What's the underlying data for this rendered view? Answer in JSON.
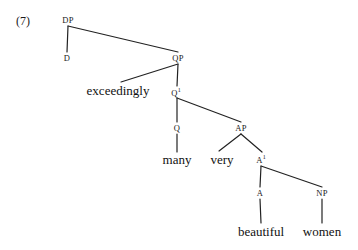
{
  "figure": {
    "example_number": "(7)",
    "kind": "syntax-tree",
    "sentence": "exceedingly many very beautiful women",
    "ink_color": "#222222",
    "background_color": "#ffffff"
  },
  "nodes": [
    {
      "id": "dp",
      "label": "DP",
      "bar": "",
      "type": "category",
      "x": 68,
      "y": 20
    },
    {
      "id": "d",
      "label": "D",
      "bar": "",
      "type": "category",
      "x": 67,
      "y": 58
    },
    {
      "id": "qp",
      "label": "QP",
      "bar": "",
      "type": "category",
      "x": 178,
      "y": 58
    },
    {
      "id": "exceedingly",
      "label": "exceedingly",
      "bar": "",
      "type": "terminal",
      "x": 118,
      "y": 90
    },
    {
      "id": "qbar",
      "label": "Q",
      "bar": "1",
      "type": "category",
      "x": 176,
      "y": 92
    },
    {
      "id": "q",
      "label": "Q",
      "bar": "",
      "type": "category",
      "x": 177,
      "y": 128
    },
    {
      "id": "ap",
      "label": "AP",
      "bar": "",
      "type": "category",
      "x": 241,
      "y": 128
    },
    {
      "id": "many",
      "label": "many",
      "bar": "",
      "type": "terminal",
      "x": 177,
      "y": 159
    },
    {
      "id": "very",
      "label": "very",
      "bar": "",
      "type": "terminal",
      "x": 222,
      "y": 159
    },
    {
      "id": "abar",
      "label": "A",
      "bar": "1",
      "type": "category",
      "x": 261,
      "y": 159
    },
    {
      "id": "a",
      "label": "A",
      "bar": "",
      "type": "category",
      "x": 260,
      "y": 193
    },
    {
      "id": "np",
      "label": "NP",
      "bar": "",
      "type": "category",
      "x": 322,
      "y": 193
    },
    {
      "id": "beautiful",
      "label": "beautiful",
      "bar": "",
      "type": "terminal",
      "x": 261,
      "y": 231
    },
    {
      "id": "women",
      "label": "women",
      "bar": "",
      "type": "terminal",
      "x": 322,
      "y": 231
    }
  ],
  "edges": [
    {
      "from": "dp",
      "to": "d",
      "x1": 68,
      "y1": 26,
      "x2": 67,
      "y2": 52
    },
    {
      "from": "dp",
      "to": "qp",
      "x1": 68,
      "y1": 26,
      "x2": 178,
      "y2": 52
    },
    {
      "from": "qp",
      "to": "exceedingly",
      "x1": 178,
      "y1": 64,
      "x2": 121,
      "y2": 82
    },
    {
      "from": "qp",
      "to": "qbar",
      "x1": 178,
      "y1": 64,
      "x2": 177,
      "y2": 86
    },
    {
      "from": "qbar",
      "to": "q",
      "x1": 177,
      "y1": 98,
      "x2": 177,
      "y2": 122
    },
    {
      "from": "qbar",
      "to": "ap",
      "x1": 177,
      "y1": 98,
      "x2": 241,
      "y2": 122
    },
    {
      "from": "q",
      "to": "many",
      "x1": 177,
      "y1": 134,
      "x2": 177,
      "y2": 152
    },
    {
      "from": "ap",
      "to": "very",
      "x1": 241,
      "y1": 134,
      "x2": 219,
      "y2": 151
    },
    {
      "from": "ap",
      "to": "abar",
      "x1": 241,
      "y1": 134,
      "x2": 262,
      "y2": 152
    },
    {
      "from": "abar",
      "to": "a",
      "x1": 261,
      "y1": 166,
      "x2": 260,
      "y2": 187
    },
    {
      "from": "abar",
      "to": "np",
      "x1": 261,
      "y1": 166,
      "x2": 322,
      "y2": 187
    },
    {
      "from": "a",
      "to": "beautiful",
      "x1": 260,
      "y1": 199,
      "x2": 261,
      "y2": 223
    },
    {
      "from": "np",
      "to": "women",
      "x1": 322,
      "y1": 199,
      "x2": 322,
      "y2": 223
    }
  ],
  "example_label": {
    "text": "(7)",
    "x": 16,
    "y": 14
  }
}
